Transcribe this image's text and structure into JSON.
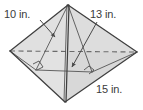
{
  "figure": {
    "kind": "triangular-pyramid-diagram",
    "colors": {
      "face_fill": "#dcdcdc",
      "face_fill_light": "#e4e4e4",
      "face_fill_dark": "#d2d2d2",
      "edge": "#4a4a4a",
      "hidden_edge": "#6e6e6e",
      "label_text": "#3b3b3b",
      "leader": "#5a5a5a",
      "background": "#ffffff"
    },
    "vertices": {
      "apex": {
        "x": 68,
        "y": 5
      },
      "left": {
        "x": 10,
        "y": 51
      },
      "right": {
        "x": 137,
        "y": 52
      },
      "front": {
        "x": 65,
        "y": 102
      },
      "interior_foot": {
        "x": 60,
        "y": 62
      }
    },
    "labels": [
      {
        "id": "slant-height",
        "text": "10 in.",
        "leader_from": {
          "x": 40,
          "y": 20
        },
        "leader_to": {
          "x": 56,
          "y": 38
        }
      },
      {
        "id": "lateral-edge",
        "text": "13 in.",
        "leader_from": {
          "x": 96,
          "y": 22
        },
        "leader_to": {
          "x": 71,
          "y": 68
        }
      },
      {
        "id": "base-edge",
        "text": "15 in."
      }
    ],
    "right_angle_marks": [
      {
        "id": "left-right-angle",
        "x": 38,
        "y": 68
      },
      {
        "id": "right-right-angle",
        "x": 88,
        "y": 70
      }
    ],
    "hidden_edge": {
      "id": "back-base-edge",
      "from": {
        "x": 10,
        "y": 51
      },
      "to": {
        "x": 137,
        "y": 52
      },
      "style": "dashed"
    }
  }
}
